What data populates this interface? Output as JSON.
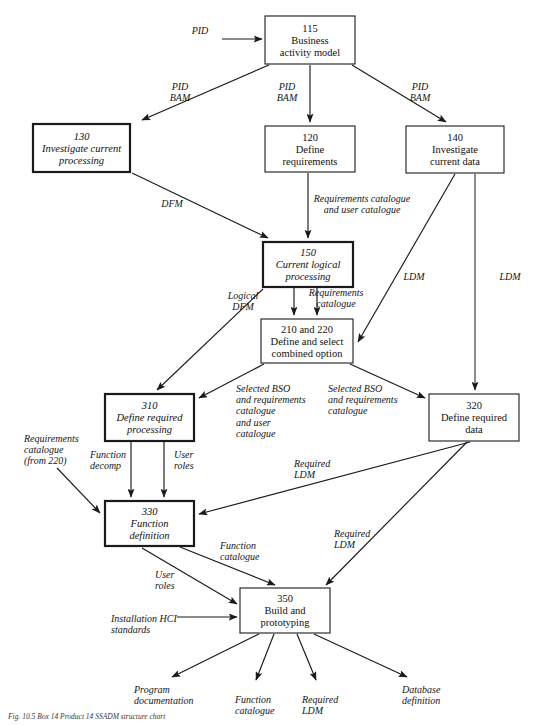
{
  "figure": {
    "caption": "Fig. 10.5   Box 14 Product 14 SSADM structure chart"
  },
  "boxes": [
    {
      "id": "115",
      "number": "115",
      "lines": [
        "Business",
        "activity model"
      ],
      "italic": false,
      "bold_border": false,
      "x": 265,
      "y": 16,
      "w": 90,
      "h": 48
    },
    {
      "id": "130",
      "number": "130",
      "lines": [
        "Investigate current",
        "processing"
      ],
      "italic": true,
      "bold_border": true,
      "x": 33,
      "y": 124,
      "w": 97,
      "h": 48
    },
    {
      "id": "120",
      "number": "120",
      "lines": [
        "Define",
        "requirements"
      ],
      "italic": false,
      "bold_border": false,
      "x": 265,
      "y": 126,
      "w": 90,
      "h": 46
    },
    {
      "id": "140",
      "number": "140",
      "lines": [
        "Investigate",
        "current data"
      ],
      "italic": false,
      "bold_border": false,
      "x": 406,
      "y": 126,
      "w": 98,
      "h": 47
    },
    {
      "id": "150",
      "number": "150",
      "lines": [
        "Current logical",
        "processing"
      ],
      "italic": true,
      "bold_border": true,
      "x": 263,
      "y": 242,
      "w": 90,
      "h": 45
    },
    {
      "id": "210and220",
      "number": "210 and 220",
      "lines": [
        "Define and select",
        "combined option"
      ],
      "italic": false,
      "bold_border": false,
      "x": 261,
      "y": 319,
      "w": 92,
      "h": 44
    },
    {
      "id": "310",
      "number": "310",
      "lines": [
        "Define required",
        "processing"
      ],
      "italic": true,
      "bold_border": true,
      "x": 105,
      "y": 394,
      "w": 89,
      "h": 47
    },
    {
      "id": "320",
      "number": "320",
      "lines": [
        "Define required",
        "data"
      ],
      "italic": false,
      "bold_border": false,
      "x": 429,
      "y": 394,
      "w": 90,
      "h": 47
    },
    {
      "id": "330",
      "number": "330",
      "lines": [
        "Function",
        "definition"
      ],
      "italic": true,
      "bold_border": true,
      "x": 105,
      "y": 501,
      "w": 89,
      "h": 45
    },
    {
      "id": "350",
      "number": "350",
      "lines": [
        "Build and",
        "prototyping"
      ],
      "italic": false,
      "bold_border": false,
      "x": 240,
      "y": 588,
      "w": 90,
      "h": 45
    }
  ],
  "edge_labels": [
    {
      "id": "pid-input",
      "lines": [
        "PID"
      ],
      "x": 200,
      "y": 34,
      "anchor": "middle"
    },
    {
      "id": "pid-bam-left",
      "lines": [
        "PID",
        "BAM"
      ],
      "x": 180,
      "y": 90,
      "anchor": "middle"
    },
    {
      "id": "pid-bam-centre",
      "lines": [
        "PID",
        "BAM"
      ],
      "x": 287,
      "y": 90,
      "anchor": "middle"
    },
    {
      "id": "pid-bam-right",
      "lines": [
        "PID",
        "BAM"
      ],
      "x": 420,
      "y": 90,
      "anchor": "middle"
    },
    {
      "id": "dfm",
      "lines": [
        "DFM"
      ],
      "x": 172,
      "y": 207,
      "anchor": "middle"
    },
    {
      "id": "req-cat-user-cat",
      "lines": [
        "Requirements catalogue",
        "and user catalogue"
      ],
      "x": 362,
      "y": 202,
      "anchor": "middle"
    },
    {
      "id": "ldm-mid",
      "lines": [
        "LDM"
      ],
      "x": 414,
      "y": 280,
      "anchor": "middle"
    },
    {
      "id": "ldm-right",
      "lines": [
        "LDM"
      ],
      "x": 510,
      "y": 280,
      "anchor": "middle"
    },
    {
      "id": "logical-dfm",
      "lines": [
        "Logical",
        "DFM"
      ],
      "x": 243,
      "y": 299,
      "anchor": "middle"
    },
    {
      "id": "requirements-cat",
      "lines": [
        "Requirements",
        "catalogue"
      ],
      "x": 336,
      "y": 296,
      "anchor": "middle"
    },
    {
      "id": "selected-bso-left",
      "lines": [
        "Selected BSO",
        "and requirements",
        "catalogue",
        "and user",
        "catalogue"
      ],
      "x": 236,
      "y": 392,
      "anchor": "start"
    },
    {
      "id": "selected-bso-right",
      "lines": [
        "Selected BSO",
        "and requirements",
        "catalogue"
      ],
      "x": 328,
      "y": 392,
      "anchor": "start"
    },
    {
      "id": "req-cat-from-220",
      "lines": [
        "Requirements",
        "catalogue",
        "(from 220)"
      ],
      "x": 24,
      "y": 442,
      "anchor": "start"
    },
    {
      "id": "function-decomp",
      "lines": [
        "Function",
        "decomp"
      ],
      "x": 90,
      "y": 458,
      "anchor": "start"
    },
    {
      "id": "user-roles-330",
      "lines": [
        "User",
        "roles"
      ],
      "x": 174,
      "y": 458,
      "anchor": "start"
    },
    {
      "id": "required-ldm-330",
      "lines": [
        "Required",
        "LDM"
      ],
      "x": 294,
      "y": 467,
      "anchor": "start"
    },
    {
      "id": "function-catalogue",
      "lines": [
        "Function",
        "catalogue"
      ],
      "x": 220,
      "y": 549,
      "anchor": "start"
    },
    {
      "id": "required-ldm-350",
      "lines": [
        "Required",
        "LDM"
      ],
      "x": 334,
      "y": 537,
      "anchor": "start"
    },
    {
      "id": "user-roles-350",
      "lines": [
        "User",
        "roles"
      ],
      "x": 155,
      "y": 578,
      "anchor": "start"
    },
    {
      "id": "installation-hci",
      "lines": [
        "Installation HCI",
        "standards"
      ],
      "x": 111,
      "y": 622,
      "anchor": "start"
    },
    {
      "id": "program-documentation",
      "lines": [
        "Program",
        "documentation"
      ],
      "x": 134,
      "y": 693,
      "anchor": "start"
    },
    {
      "id": "function-cat-out",
      "lines": [
        "Function",
        "catalogue"
      ],
      "x": 235,
      "y": 703,
      "anchor": "start"
    },
    {
      "id": "required-ldm-out",
      "lines": [
        "Required",
        "LDM"
      ],
      "x": 302,
      "y": 703,
      "anchor": "start"
    },
    {
      "id": "database-definition",
      "lines": [
        "Database",
        "definition"
      ],
      "x": 402,
      "y": 693,
      "anchor": "start"
    }
  ],
  "colors": {
    "line": "#1a1a1a",
    "text": "#101010",
    "background": "#ffffff"
  }
}
